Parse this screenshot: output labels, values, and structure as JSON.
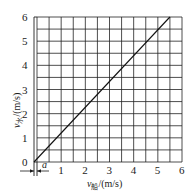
{
  "chart_data": {
    "type": "line",
    "title": "",
    "xlabel": "v船/(m/s)",
    "ylabel": "v水/(m/s)",
    "xlabel_parts": {
      "sym": "v",
      "sub": "船",
      "unit": "/(m/s)"
    },
    "ylabel_parts": {
      "sym": "v",
      "sub": "水",
      "unit": "/(m/s)"
    },
    "xlim": [
      0,
      6
    ],
    "ylim": [
      0,
      6
    ],
    "x_ticks": [
      "0",
      "1",
      "2",
      "3",
      "4",
      "5",
      "6"
    ],
    "y_ticks": [
      "0",
      "1",
      "2",
      "3",
      "4",
      "5",
      "6"
    ],
    "grid": true,
    "grid_step": 0.5,
    "series": [
      {
        "name": "line",
        "x": [
          0.0,
          5.5
        ],
        "y": [
          0.0,
          6.0
        ]
      }
    ],
    "annotations": [
      {
        "text": "a",
        "note": "small offset marked between origin and grid left edge with arrows"
      }
    ]
  },
  "labels": {
    "origin": "0",
    "offset_marker": "a"
  }
}
